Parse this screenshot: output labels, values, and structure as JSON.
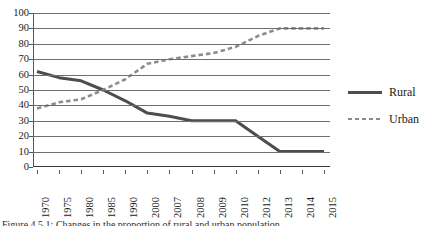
{
  "chart_data": {
    "type": "line",
    "title": "",
    "subtitle": "",
    "xlabel": "",
    "ylabel": "",
    "ylim": [
      0,
      100
    ],
    "ytick_step": 10,
    "yticks": [
      100,
      90,
      80,
      70,
      60,
      50,
      40,
      30,
      20,
      10,
      0
    ],
    "grid": true,
    "grid_axis": "y",
    "legend_position": "right",
    "x_tick_rotation": -90,
    "categories": [
      "1970",
      "1975",
      "1980",
      "1985",
      "1990",
      "2000",
      "2007",
      "2008",
      "2009",
      "2010",
      "2012",
      "2013",
      "2014",
      "2015"
    ],
    "series": [
      {
        "name": "Rural",
        "style": "solid",
        "color": "#4d4d4d",
        "values": [
          62,
          58,
          56,
          50,
          43,
          35,
          33,
          30,
          30,
          30,
          20,
          10,
          10,
          10
        ]
      },
      {
        "name": "Urban",
        "style": "dashed",
        "color": "#8c8c8c",
        "values": [
          38,
          42,
          44,
          50,
          57,
          67,
          70,
          72,
          74,
          78,
          85,
          90,
          90,
          90
        ]
      }
    ],
    "annotations": []
  },
  "legend": {
    "items": [
      {
        "label": "Rural",
        "swatch": "solid-line-swatch"
      },
      {
        "label": "Urban",
        "swatch": "dashed-line-swatch"
      }
    ]
  },
  "caption": {
    "text": "Figure 4.5.1: Changes in the proportion of rural and urban population"
  },
  "colors": {
    "rural": "#4d4d4d",
    "urban": "#8c8c8c",
    "gridline": "#6e6e6e",
    "axis": "#555555",
    "background": "#ffffff"
  }
}
